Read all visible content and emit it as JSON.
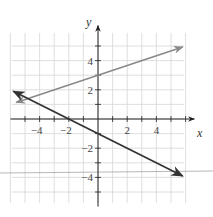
{
  "chart_data": {
    "type": "line",
    "title": "",
    "xlabel": "x",
    "ylabel": "y",
    "xlim": [
      -6,
      6
    ],
    "ylim": [
      -6,
      6
    ],
    "grid": true,
    "x_ticks": [
      -4,
      -2,
      2,
      4
    ],
    "y_ticks": [
      -4,
      -2,
      2,
      4
    ],
    "x_tick_labels": [
      "−4",
      "−2",
      "2",
      "4"
    ],
    "y_tick_labels": [
      "−4",
      "−2",
      "2",
      "4"
    ],
    "series": [
      {
        "name": "y = x/3 + 3",
        "color": "#888888",
        "x": [
          -5.6,
          5.8
        ],
        "y": [
          1.13,
          4.93
        ],
        "arrows": "both"
      },
      {
        "name": "y = -x/2 - 1",
        "color": "#333333",
        "x": [
          -5.8,
          5.8
        ],
        "y": [
          1.9,
          -3.9
        ],
        "arrows": "both"
      }
    ],
    "annotations": [
      "horizontal reference line near y = -3.8"
    ]
  },
  "labels": {
    "x": "x",
    "y": "y"
  }
}
